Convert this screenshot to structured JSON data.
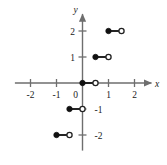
{
  "chart_data": {
    "type": "line",
    "title": "",
    "xlabel": "x",
    "ylabel": "y",
    "xlim": [
      -2.6,
      2.6
    ],
    "ylim": [
      -2.6,
      2.6
    ],
    "grid": false,
    "legend": null,
    "x_ticks": [
      -2,
      -1,
      1,
      2
    ],
    "x_tick_labels": [
      "-2",
      "-1",
      "1",
      "2"
    ],
    "y_ticks": [
      -2,
      -1,
      1,
      2
    ],
    "y_tick_labels": [
      "-2",
      "-1",
      "1",
      "2"
    ],
    "origin_label": "0",
    "segments": [
      {
        "y": 2,
        "x_start": 1.0,
        "x_end": 1.5,
        "left_endpoint": "closed",
        "right_endpoint": "open"
      },
      {
        "y": 1,
        "x_start": 0.5,
        "x_end": 1.0,
        "left_endpoint": "closed",
        "right_endpoint": "open"
      },
      {
        "y": 0,
        "x_start": 0.0,
        "x_end": 0.5,
        "left_endpoint": "closed",
        "right_endpoint": "open"
      },
      {
        "y": -1,
        "x_start": -0.5,
        "x_end": 0.0,
        "left_endpoint": "closed",
        "right_endpoint": "open"
      },
      {
        "y": -2,
        "x_start": -1.0,
        "x_end": -0.5,
        "left_endpoint": "closed",
        "right_endpoint": "open"
      }
    ],
    "colors": {
      "axis": "#6e6e6e",
      "curve": "#1a1a1a",
      "closed_marker": "#111111",
      "open_marker_fill": "#ffffff",
      "background": "#ffffff"
    }
  }
}
